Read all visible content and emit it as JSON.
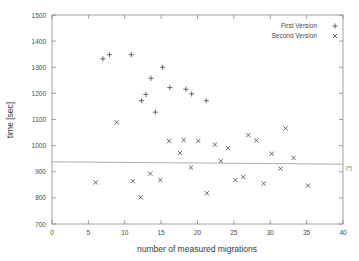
{
  "chart_data": {
    "type": "scatter",
    "title": "",
    "xlabel": "number of measured migrations",
    "ylabel": "time [sec]",
    "xlim": [
      0,
      40
    ],
    "ylim": [
      700,
      1500
    ],
    "xticks": [
      0,
      5,
      10,
      15,
      20,
      25,
      30,
      35,
      40
    ],
    "yticks": [
      700,
      800,
      900,
      1000,
      1100,
      1200,
      1300,
      1400,
      1500
    ],
    "grid": false,
    "legend_position": "top-right",
    "series": [
      {
        "name": "First Version",
        "marker": "plus",
        "points": [
          [
            7.0,
            1332
          ],
          [
            7.9,
            1348
          ],
          [
            10.9,
            1348
          ],
          [
            12.3,
            1172
          ],
          [
            12.9,
            1196
          ],
          [
            13.6,
            1258
          ],
          [
            14.2,
            1128
          ],
          [
            15.2,
            1300
          ],
          [
            16.2,
            1222
          ],
          [
            18.4,
            1216
          ],
          [
            19.2,
            1198
          ],
          [
            21.2,
            1172
          ]
        ]
      },
      {
        "name": "Second Version",
        "marker": "cross",
        "points": [
          [
            6.0,
            859
          ],
          [
            8.9,
            1089
          ],
          [
            11.1,
            864
          ],
          [
            12.2,
            802
          ],
          [
            13.5,
            893
          ],
          [
            14.9,
            868
          ],
          [
            16.1,
            1017
          ],
          [
            17.6,
            972
          ],
          [
            18.1,
            1021
          ],
          [
            19.1,
            916
          ],
          [
            20.1,
            1018
          ],
          [
            21.3,
            818
          ],
          [
            22.4,
            1004
          ],
          [
            23.2,
            941
          ],
          [
            24.2,
            990
          ],
          [
            25.2,
            868
          ],
          [
            26.3,
            880
          ],
          [
            27.0,
            1040
          ],
          [
            28.1,
            1020
          ],
          [
            29.1,
            855
          ],
          [
            30.2,
            969
          ],
          [
            31.4,
            912
          ],
          [
            32.1,
            1066
          ],
          [
            33.2,
            953
          ],
          [
            35.2,
            847
          ]
        ]
      }
    ],
    "reference_line": {
      "label": "(*)",
      "y_start": 938,
      "y_end": 929,
      "x_start": 0,
      "x_end": 40
    }
  },
  "legend": {
    "entries": [
      {
        "label": "First Version",
        "marker": "+"
      },
      {
        "label": "Second Version",
        "marker": "x"
      }
    ]
  },
  "axes": {
    "x_title": "number of measured migrations",
    "y_title": "time [sec]"
  }
}
